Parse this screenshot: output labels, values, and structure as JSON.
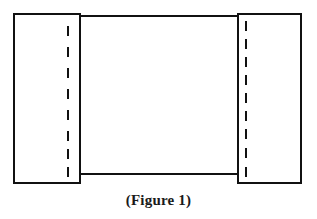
{
  "figure": {
    "caption": "(Figure 1)",
    "background_color": "#ffffff",
    "stroke_color": "#111111",
    "caption_color": "#1a1a1a",
    "canvas": {
      "width": 317,
      "height": 219
    },
    "shapes": {
      "left_plate": {
        "name": "left-plate",
        "x": 14,
        "y": 14,
        "width": 66,
        "height": 169,
        "stroke_width": 2.2
      },
      "right_plate": {
        "name": "right-plate",
        "x": 238,
        "y": 14,
        "width": 63,
        "height": 169,
        "stroke_width": 2.2
      },
      "middle_band_top_line": {
        "name": "middle-band-top-edge",
        "x1": 80,
        "y1": 16,
        "x2": 238,
        "y2": 16,
        "stroke_width": 2.0
      },
      "middle_band_bottom_line": {
        "name": "middle-band-bottom-edge",
        "x1": 80,
        "y1": 174,
        "x2": 238,
        "y2": 174,
        "stroke_width": 2.0
      },
      "left_fold_line": {
        "name": "left-fold-dashed-line",
        "x": 68,
        "y_start": 24,
        "y_end": 177,
        "dash_count": 8,
        "dash_length": 8,
        "dash_gap": 13,
        "stroke_width": 2.6
      },
      "right_fold_line": {
        "name": "right-fold-dashed-line",
        "x": 246,
        "y_start": 20,
        "y_end": 178,
        "dash_count": 9,
        "dash_length": 8,
        "dash_gap": 10,
        "stroke_width": 2.6
      }
    }
  }
}
